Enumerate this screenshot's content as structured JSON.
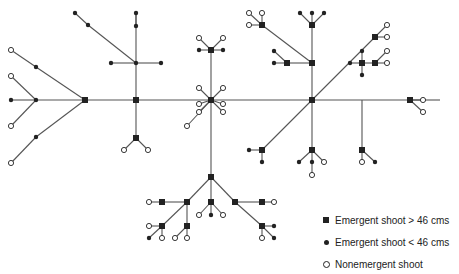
{
  "legend": {
    "items": [
      {
        "symbol": "filled-square",
        "label": "Emergent shoot > 46 cms"
      },
      {
        "symbol": "filled-dot",
        "label": "Emergent shoot < 46 cms"
      },
      {
        "symbol": "open-circle",
        "label": "Nonemergent shoot"
      }
    ]
  },
  "colors": {
    "line": "#555555",
    "node": "#222222",
    "background": "#ffffff"
  },
  "edges": [
    [
      11,
      50,
      36,
      67
    ],
    [
      36,
      67,
      85,
      100
    ],
    [
      11,
      76,
      36,
      100
    ],
    [
      11,
      100,
      36,
      100
    ],
    [
      11,
      126,
      36,
      100
    ],
    [
      36,
      100,
      85,
      100
    ],
    [
      85,
      100,
      36,
      137
    ],
    [
      36,
      137,
      11,
      163
    ],
    [
      85,
      100,
      136,
      100
    ],
    [
      136,
      100,
      211,
      100
    ],
    [
      211,
      100,
      312,
      100
    ],
    [
      312,
      100,
      362,
      100
    ],
    [
      362,
      100,
      410,
      100
    ],
    [
      410,
      100,
      440,
      100
    ],
    [
      136,
      100,
      136,
      13
    ],
    [
      136,
      13,
      136,
      26
    ],
    [
      75,
      13,
      88,
      25
    ],
    [
      88,
      25,
      136,
      63
    ],
    [
      111,
      63,
      136,
      63
    ],
    [
      136,
      63,
      161,
      63
    ],
    [
      136,
      100,
      136,
      138
    ],
    [
      136,
      138,
      124,
      150
    ],
    [
      136,
      138,
      148,
      150
    ],
    [
      211,
      100,
      211,
      50
    ],
    [
      211,
      50,
      199,
      38
    ],
    [
      211,
      50,
      223,
      38
    ],
    [
      199,
      50,
      211,
      50
    ],
    [
      211,
      50,
      223,
      50
    ],
    [
      211,
      100,
      199,
      88
    ],
    [
      211,
      100,
      223,
      88
    ],
    [
      211,
      100,
      199,
      104
    ],
    [
      211,
      100,
      223,
      104
    ],
    [
      211,
      100,
      199,
      112
    ],
    [
      211,
      100,
      223,
      112
    ],
    [
      211,
      100,
      187,
      126
    ],
    [
      211,
      100,
      211,
      177
    ],
    [
      211,
      177,
      187,
      202
    ],
    [
      211,
      177,
      235,
      202
    ],
    [
      211,
      177,
      211,
      202
    ],
    [
      211,
      202,
      199,
      215
    ],
    [
      211,
      202,
      211,
      215
    ],
    [
      211,
      202,
      223,
      215
    ],
    [
      187,
      202,
      162,
      202
    ],
    [
      162,
      202,
      149,
      202
    ],
    [
      187,
      202,
      162,
      226
    ],
    [
      162,
      226,
      149,
      226
    ],
    [
      162,
      226,
      149,
      238
    ],
    [
      162,
      226,
      162,
      238
    ],
    [
      187,
      202,
      187,
      226
    ],
    [
      187,
      226,
      175,
      238
    ],
    [
      187,
      226,
      187,
      238
    ],
    [
      235,
      202,
      262,
      202
    ],
    [
      262,
      202,
      274,
      202
    ],
    [
      235,
      202,
      262,
      226
    ],
    [
      262,
      226,
      274,
      226
    ],
    [
      262,
      226,
      262,
      238
    ],
    [
      262,
      226,
      274,
      238
    ],
    [
      312,
      100,
      312,
      25
    ],
    [
      312,
      25,
      300,
      13
    ],
    [
      312,
      25,
      312,
      13
    ],
    [
      312,
      25,
      324,
      13
    ],
    [
      312,
      63,
      262,
      25
    ],
    [
      262,
      25,
      249,
      13
    ],
    [
      262,
      25,
      262,
      13
    ],
    [
      262,
      25,
      249,
      25
    ],
    [
      312,
      63,
      287,
      63
    ],
    [
      287,
      63,
      274,
      63
    ],
    [
      287,
      63,
      274,
      51
    ],
    [
      312,
      100,
      375,
      37
    ],
    [
      375,
      37,
      387,
      25
    ],
    [
      375,
      37,
      387,
      37
    ],
    [
      350,
      63,
      362,
      63
    ],
    [
      362,
      63,
      375,
      63
    ],
    [
      362,
      51,
      362,
      75
    ],
    [
      375,
      63,
      387,
      63
    ],
    [
      375,
      63,
      387,
      51
    ],
    [
      312,
      100,
      262,
      150
    ],
    [
      262,
      150,
      249,
      150
    ],
    [
      262,
      150,
      262,
      162
    ],
    [
      312,
      100,
      312,
      150
    ],
    [
      312,
      150,
      299,
      162
    ],
    [
      312,
      150,
      312,
      162
    ],
    [
      312,
      150,
      324,
      162
    ],
    [
      312,
      162,
      312,
      175
    ],
    [
      362,
      100,
      362,
      150
    ],
    [
      362,
      150,
      362,
      162
    ],
    [
      362,
      150,
      375,
      162
    ],
    [
      410,
      100,
      423,
      100
    ],
    [
      410,
      100,
      423,
      112
    ]
  ],
  "squares": [
    [
      85,
      100
    ],
    [
      136,
      100
    ],
    [
      136,
      138
    ],
    [
      211,
      50
    ],
    [
      211,
      100
    ],
    [
      211,
      177
    ],
    [
      211,
      202
    ],
    [
      187,
      202
    ],
    [
      162,
      202
    ],
    [
      162,
      226
    ],
    [
      187,
      226
    ],
    [
      235,
      202
    ],
    [
      262,
      202
    ],
    [
      262,
      226
    ],
    [
      312,
      100
    ],
    [
      312,
      25
    ],
    [
      262,
      25
    ],
    [
      312,
      63
    ],
    [
      287,
      63
    ],
    [
      375,
      37
    ],
    [
      362,
      63
    ],
    [
      375,
      63
    ],
    [
      262,
      150
    ],
    [
      312,
      150
    ],
    [
      362,
      150
    ],
    [
      410,
      100
    ]
  ],
  "dots": [
    [
      36,
      67
    ],
    [
      36,
      100
    ],
    [
      11,
      100
    ],
    [
      36,
      137
    ],
    [
      75,
      13
    ],
    [
      88,
      25
    ],
    [
      136,
      13
    ],
    [
      136,
      26
    ],
    [
      111,
      63
    ],
    [
      136,
      63
    ],
    [
      161,
      63
    ],
    [
      199,
      50
    ],
    [
      223,
      50
    ],
    [
      211,
      215
    ],
    [
      149,
      238
    ],
    [
      274,
      226
    ],
    [
      274,
      238
    ],
    [
      300,
      13
    ],
    [
      312,
      13
    ],
    [
      324,
      13
    ],
    [
      274,
      63
    ],
    [
      274,
      51
    ],
    [
      350,
      63
    ],
    [
      362,
      51
    ],
    [
      362,
      75
    ],
    [
      249,
      150
    ],
    [
      262,
      162
    ],
    [
      299,
      162
    ],
    [
      312,
      162
    ],
    [
      375,
      162
    ]
  ],
  "circles": [
    [
      11,
      50
    ],
    [
      11,
      76
    ],
    [
      11,
      126
    ],
    [
      11,
      163
    ],
    [
      124,
      150
    ],
    [
      148,
      150
    ],
    [
      199,
      38
    ],
    [
      223,
      38
    ],
    [
      199,
      88
    ],
    [
      223,
      88
    ],
    [
      199,
      104
    ],
    [
      223,
      104
    ],
    [
      199,
      112
    ],
    [
      223,
      112
    ],
    [
      187,
      126
    ],
    [
      199,
      215
    ],
    [
      223,
      215
    ],
    [
      149,
      202
    ],
    [
      149,
      226
    ],
    [
      162,
      238
    ],
    [
      175,
      238
    ],
    [
      187,
      238
    ],
    [
      274,
      202
    ],
    [
      262,
      238
    ],
    [
      249,
      13
    ],
    [
      262,
      13
    ],
    [
      249,
      25
    ],
    [
      387,
      25
    ],
    [
      387,
      37
    ],
    [
      387,
      63
    ],
    [
      387,
      51
    ],
    [
      312,
      175
    ],
    [
      324,
      162
    ],
    [
      362,
      162
    ],
    [
      423,
      100
    ],
    [
      423,
      112
    ]
  ]
}
